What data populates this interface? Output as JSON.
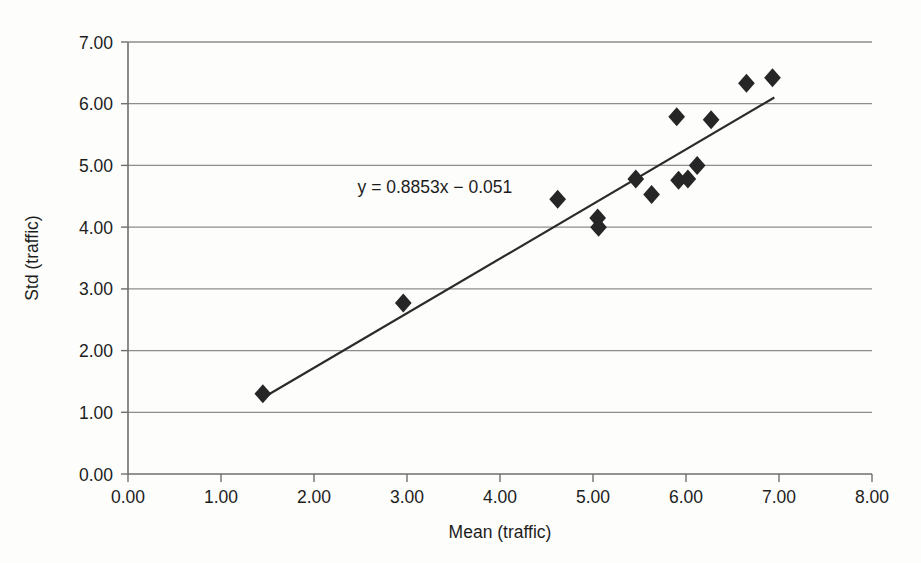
{
  "chart_data": {
    "type": "scatter",
    "title": "",
    "xlabel": "Mean (traffic)",
    "ylabel": "Std (traffic)",
    "xlim": [
      0,
      8
    ],
    "ylim": [
      0,
      7
    ],
    "xticks": [
      "0.00",
      "1.00",
      "2.00",
      "3.00",
      "4.00",
      "5.00",
      "6.00",
      "7.00",
      "8.00"
    ],
    "yticks": [
      "0.00",
      "1.00",
      "2.00",
      "3.00",
      "4.00",
      "5.00",
      "6.00",
      "7.00"
    ],
    "grid": "horizontal",
    "legend": "none",
    "marker_shape": "diamond",
    "marker_color": "#262626",
    "series": [
      {
        "name": "traffic",
        "points": [
          [
            1.45,
            1.3
          ],
          [
            2.96,
            2.77
          ],
          [
            4.62,
            4.45
          ],
          [
            5.05,
            4.15
          ],
          [
            5.06,
            4.0
          ],
          [
            5.46,
            4.78
          ],
          [
            5.63,
            4.53
          ],
          [
            5.9,
            5.79
          ],
          [
            5.92,
            4.76
          ],
          [
            6.02,
            4.78
          ],
          [
            6.12,
            5.0
          ],
          [
            6.27,
            5.74
          ],
          [
            6.65,
            6.33
          ],
          [
            6.93,
            6.42
          ]
        ]
      }
    ],
    "trendline": {
      "equation": "y = 0.8853x − 0.051",
      "slope": 0.8853,
      "intercept": -0.051,
      "x_start": 1.42,
      "x_end": 6.95,
      "label_x": 3.3,
      "label_y": 4.55
    }
  },
  "annotations": {
    "equation_text": "y = 0.8853x − 0.051"
  }
}
